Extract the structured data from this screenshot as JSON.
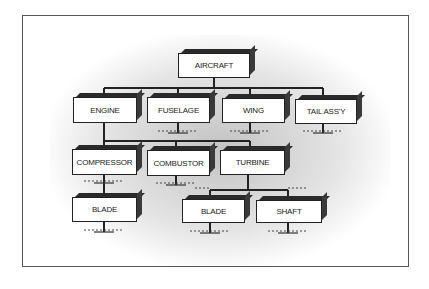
{
  "diagram": {
    "type": "hierarchy-tree",
    "root": {
      "id": "aircraft",
      "label": "AIRCRAFT"
    },
    "level1": [
      {
        "id": "engine",
        "label": "ENGINE"
      },
      {
        "id": "fuselage",
        "label": "FUSELAGE"
      },
      {
        "id": "wing",
        "label": "WING"
      },
      {
        "id": "tail",
        "label": "TAIL ASS'Y"
      }
    ],
    "level2": [
      {
        "id": "compressor",
        "label": "COMPRESSOR",
        "parent": "engine"
      },
      {
        "id": "combustor",
        "label": "COMBUSTOR",
        "parent": "engine"
      },
      {
        "id": "turbine",
        "label": "TURBINE",
        "parent": "engine"
      }
    ],
    "level3": [
      {
        "id": "blade1",
        "label": "BLADE",
        "parent": "compressor"
      },
      {
        "id": "blade2",
        "label": "BLADE",
        "parent": "turbine"
      },
      {
        "id": "shaft",
        "label": "SHAFT",
        "parent": "turbine"
      }
    ],
    "colors": {
      "line": "#222222",
      "box_fill": "#ffffff",
      "box_top": "#2a2a2a",
      "shading": "#8a8a8a"
    }
  }
}
